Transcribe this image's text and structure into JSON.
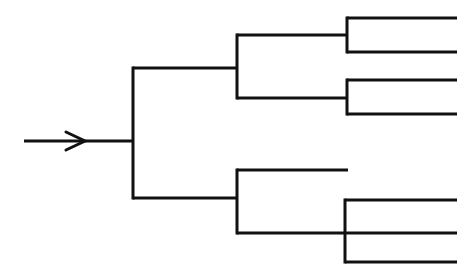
{
  "diagram": {
    "type": "tree-diagram",
    "canvas": {
      "width": 474,
      "height": 274,
      "background": "#ffffff"
    },
    "style": {
      "line_color": "#111111",
      "line_width": 3
    },
    "input": {
      "label": "input-arrow",
      "shaft_start_x": 24,
      "shaft_end_x": 133,
      "y": 141,
      "arrowhead_tip_x": 85,
      "arrowhead_back_x": 66,
      "arrowhead_half_height": 9
    },
    "nodes": [
      {
        "name": "root-split",
        "x": 133,
        "top_y": 68,
        "bottom_y": 198,
        "inlet_y": 141,
        "upper_branch_end_x": 237,
        "lower_branch_end_x": 237
      },
      {
        "name": "upper-split",
        "x": 237,
        "top_y": 35,
        "bottom_y": 98,
        "inlet_y": 68,
        "upper_branch_end_x": 347,
        "lower_branch_end_x": 347
      },
      {
        "name": "lower-split",
        "x": 237,
        "top_y": 170,
        "bottom_y": 233,
        "inlet_y": 198,
        "upper_branch_end_x": 348,
        "lower_branch_end_x": 457
      },
      {
        "name": "upper-leaf-split-a",
        "x": 347,
        "top_y": 18,
        "bottom_y": 52,
        "inlet_y": 35,
        "upper_branch_end_x": 457,
        "lower_branch_end_x": 457
      },
      {
        "name": "upper-leaf-split-b",
        "x": 347,
        "top_y": 80,
        "bottom_y": 114,
        "inlet_y": 98,
        "upper_branch_end_x": 457,
        "lower_branch_end_x": 457
      },
      {
        "name": "lower-leaf-split",
        "x": 345,
        "top_y": 200,
        "bottom_y": 262,
        "inlet_y": 233,
        "upper_branch_end_x": 457,
        "lower_branch_end_x": 457
      }
    ],
    "terminal_lines": [
      {
        "name": "terminal-1",
        "y": 18,
        "x1": 347,
        "x2": 457
      },
      {
        "name": "terminal-2",
        "y": 52,
        "x1": 347,
        "x2": 457
      },
      {
        "name": "terminal-3",
        "y": 80,
        "x1": 347,
        "x2": 457
      },
      {
        "name": "terminal-4",
        "y": 114,
        "x1": 347,
        "x2": 457
      },
      {
        "name": "terminal-5",
        "y": 170,
        "x1": 237,
        "x2": 348
      },
      {
        "name": "terminal-6",
        "y": 200,
        "x1": 345,
        "x2": 457
      },
      {
        "name": "terminal-7",
        "y": 233,
        "x1": 237,
        "x2": 457
      },
      {
        "name": "terminal-8",
        "y": 262,
        "x1": 345,
        "x2": 457
      }
    ]
  }
}
